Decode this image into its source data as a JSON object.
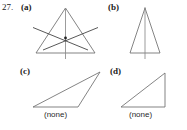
{
  "figure": {
    "problem_number": "27.",
    "panels": [
      {
        "key": "a",
        "label": "(a)",
        "caption": "",
        "shape": "acute-triangle-with-three-cevians",
        "has_concurrency_point": true
      },
      {
        "key": "b",
        "label": "(b)",
        "caption": "",
        "shape": "narrow-isosceles-triangle-with-vertical-axis",
        "has_concurrency_point": false
      },
      {
        "key": "c",
        "label": "(c)",
        "caption": "(none)",
        "shape": "obtuse-scalene-triangle",
        "has_concurrency_point": false
      },
      {
        "key": "d",
        "label": "(d)",
        "caption": "(none)",
        "shape": "right-triangle",
        "has_concurrency_point": false
      }
    ],
    "colors": {
      "background": "#ffffff",
      "outline": "#6e6e6e",
      "cevian": "#3a3a3a",
      "text": "#1a1a1a"
    }
  }
}
